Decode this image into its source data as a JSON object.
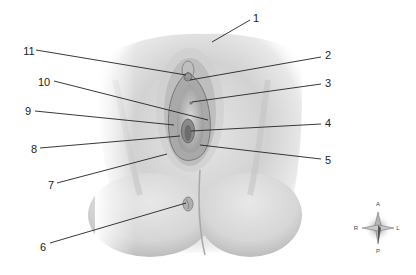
{
  "diagram": {
    "type": "anatomical-illustration",
    "labels": [
      {
        "id": "1",
        "text": "1",
        "x": 256,
        "y": 18,
        "line": [
          [
            250,
            20
          ],
          [
            212,
            42
          ]
        ]
      },
      {
        "id": "2",
        "text": "2",
        "x": 328,
        "y": 55,
        "line": [
          [
            321,
            57
          ],
          [
            190,
            80
          ]
        ]
      },
      {
        "id": "3",
        "text": "3",
        "x": 328,
        "y": 83,
        "line": [
          [
            321,
            84
          ],
          [
            192,
            102
          ]
        ]
      },
      {
        "id": "4",
        "text": "4",
        "x": 328,
        "y": 123,
        "line": [
          [
            321,
            124
          ],
          [
            191,
            131
          ]
        ]
      },
      {
        "id": "5",
        "text": "5",
        "x": 328,
        "y": 160,
        "line": [
          [
            321,
            159
          ],
          [
            200,
            145
          ]
        ]
      },
      {
        "id": "6",
        "text": "6",
        "x": 43,
        "y": 247,
        "line": [
          [
            50,
            243
          ],
          [
            186,
            203
          ]
        ]
      },
      {
        "id": "7",
        "text": "7",
        "x": 51,
        "y": 185,
        "line": [
          [
            57,
            183
          ],
          [
            167,
            154
          ]
        ]
      },
      {
        "id": "8",
        "text": "8",
        "x": 34,
        "y": 149,
        "line": [
          [
            40,
            148
          ],
          [
            180,
            136
          ]
        ]
      },
      {
        "id": "9",
        "text": "9",
        "x": 28,
        "y": 111,
        "line": [
          [
            35,
            111
          ],
          [
            174,
            125
          ]
        ]
      },
      {
        "id": "10",
        "text": "10",
        "x": 44,
        "y": 82,
        "line": [
          [
            54,
            81
          ],
          [
            208,
            120
          ]
        ]
      },
      {
        "id": "11",
        "text": "11",
        "x": 29,
        "y": 51,
        "line": [
          [
            36,
            50
          ],
          [
            186,
            75
          ]
        ]
      }
    ],
    "compass": {
      "x": 378,
      "y": 226,
      "top": "A",
      "bottom": "P",
      "left": "R",
      "right": "L"
    },
    "colors": {
      "skin_light": "#f4f4f4",
      "skin_mid": "#cfcfcf",
      "skin_dark": "#8a8a8a",
      "line": "#222222",
      "background": "#ffffff"
    }
  }
}
